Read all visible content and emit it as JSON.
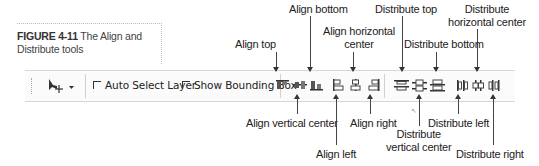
{
  "caption": {
    "figure_label": "FIGURE 4-11",
    "text": "The Align and Distribute tools"
  },
  "toolbar": {
    "move_tool": {
      "icon": "move-tool-icon",
      "dropdown_icon": "chevron-down-icon"
    },
    "auto_select_layer": {
      "label": "Auto Select Layer",
      "checked": false
    },
    "show_bounding_box": {
      "label": "Show Bounding Box",
      "checked": false
    },
    "align_buttons": [
      {
        "name": "align-top",
        "label": "Align top"
      },
      {
        "name": "align-vertical-center",
        "label": "Align vertical center"
      },
      {
        "name": "align-bottom",
        "label": "Align bottom"
      },
      {
        "name": "align-left",
        "label": "Align left"
      },
      {
        "name": "align-horizontal-center",
        "label": "Align horizontal center"
      },
      {
        "name": "align-right",
        "label": "Align right"
      }
    ],
    "distribute_buttons": [
      {
        "name": "distribute-top",
        "label": "Distribute top"
      },
      {
        "name": "distribute-vertical-center",
        "label": "Distribute vertical center"
      },
      {
        "name": "distribute-bottom",
        "label": "Distribute bottom"
      },
      {
        "name": "distribute-left",
        "label": "Distribute left"
      },
      {
        "name": "distribute-horizontal-center",
        "label": "Distribute horizontal center"
      },
      {
        "name": "distribute-right",
        "label": "Distribute right"
      }
    ]
  },
  "callouts": {
    "align_top": "Align top",
    "align_bottom": "Align bottom",
    "align_horizontal_center_1": "Align horizontal",
    "align_horizontal_center_2": "center",
    "distribute_top": "Distribute top",
    "distribute_bottom": "Distribute bottom",
    "distribute_horizontal_center_1": "Distribute",
    "distribute_horizontal_center_2": "horizontal center",
    "align_vertical_center": "Align vertical center",
    "align_right": "Align right",
    "align_left": "Align left",
    "distribute_left": "Distribute left",
    "distribute_vertical_center_1": "Distribute",
    "distribute_vertical_center_2": "vertical center",
    "distribute_right": "Distribute right"
  }
}
